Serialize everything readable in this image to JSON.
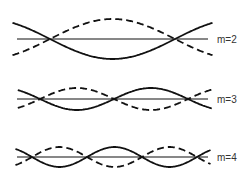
{
  "diagram": {
    "type": "standing-wave-modes",
    "colors": {
      "stroke": "#111111",
      "label": "#333333",
      "background": "#ffffff"
    },
    "modes": [
      {
        "label": "m=2",
        "axis_y": 39,
        "x_start": 17,
        "x_end": 208,
        "nodes": [
          50,
          175
        ],
        "amplitude": 20
      },
      {
        "label": "m=3",
        "axis_y": 99,
        "x_start": 17,
        "x_end": 208,
        "nodes": [
          40,
          114,
          190
        ],
        "amplitude": 11
      },
      {
        "label": "m=4",
        "axis_y": 157,
        "x_start": 17,
        "x_end": 208,
        "nodes": [
          32,
          87,
          140,
          194
        ],
        "amplitude": 10
      }
    ]
  }
}
